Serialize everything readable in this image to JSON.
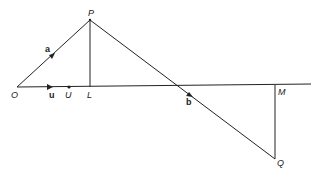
{
  "diagram": {
    "points": {
      "O": {
        "label": "O",
        "x": 17,
        "y": 87
      },
      "P": {
        "label": "P",
        "x": 90,
        "y": 20
      },
      "L": {
        "label": "L",
        "x": 90,
        "y": 87
      },
      "U": {
        "label": "U",
        "x": 69,
        "y": 87
      },
      "M": {
        "label": "M",
        "x": 275,
        "y": 85
      },
      "Q": {
        "label": "Q",
        "x": 275,
        "y": 159
      }
    },
    "vectors": {
      "a": {
        "label": "a"
      },
      "u": {
        "label": "u"
      },
      "b": {
        "label": "b"
      }
    },
    "colors": {
      "line": "#222222",
      "background": "#ffffff"
    }
  }
}
